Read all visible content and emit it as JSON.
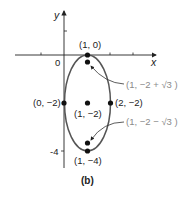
{
  "figure": {
    "caption": "(b)",
    "axes": {
      "x_label": "x",
      "y_label": "y",
      "origin_label": "0",
      "y_tick_label_neg4": "-4"
    },
    "curve": {
      "type": "ellipse",
      "center": [
        1,
        -2
      ],
      "semi_axis_x": 1,
      "semi_axis_y": 2,
      "stroke_color": "#555555"
    },
    "points": [
      {
        "label": "(1, 0)",
        "x": 1,
        "y": 0
      },
      {
        "label": "(0, −2)",
        "x": 0,
        "y": -2
      },
      {
        "label": "(1, −2)",
        "x": 1,
        "y": -2
      },
      {
        "label": "(2, −2)",
        "x": 2,
        "y": -2
      },
      {
        "label": "(1, −4)",
        "x": 1,
        "y": -4
      }
    ],
    "foci": [
      {
        "label": "(1, −2 + √3 )",
        "x": 1,
        "y": -0.268
      },
      {
        "label": "(1, −2 − √3 )",
        "x": 1,
        "y": -3.732
      }
    ],
    "callout_color": "#8a8a8a"
  }
}
